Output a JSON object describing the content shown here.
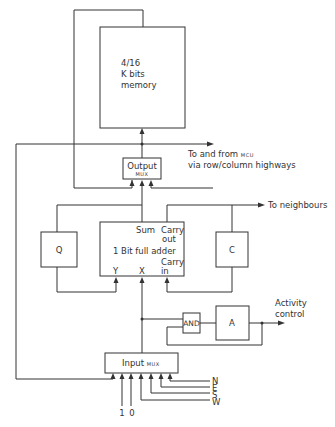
{
  "diagram": {
    "memory": {
      "line1": "4/16",
      "line2": "K bits",
      "line3": "memory"
    },
    "output_mux": {
      "label": "Output",
      "sub": "MUX"
    },
    "mcu_link": {
      "line1": "To and from",
      "line1_small": "MCU",
      "line2": "via row/column highways"
    },
    "neighbours": {
      "label": "To neighbours"
    },
    "adder": {
      "title": "1 Bit full adder",
      "sum": "Sum",
      "carry_out_1": "Carry",
      "carry_out_2": "out",
      "carry_in_1": "Carry",
      "carry_in_2": "in",
      "y": "Y",
      "x": "X"
    },
    "q_register": {
      "label": "Q"
    },
    "c_register": {
      "label": "C"
    },
    "and_gate": {
      "label": "AND"
    },
    "a_register": {
      "label": "A"
    },
    "activity": {
      "line1": "Activity",
      "line2": "control"
    },
    "input_mux": {
      "label": "Input",
      "sub": "MUX"
    },
    "inputs": {
      "constants": [
        "1",
        "0"
      ],
      "directions": [
        "N",
        "E",
        "S",
        "W"
      ]
    }
  }
}
